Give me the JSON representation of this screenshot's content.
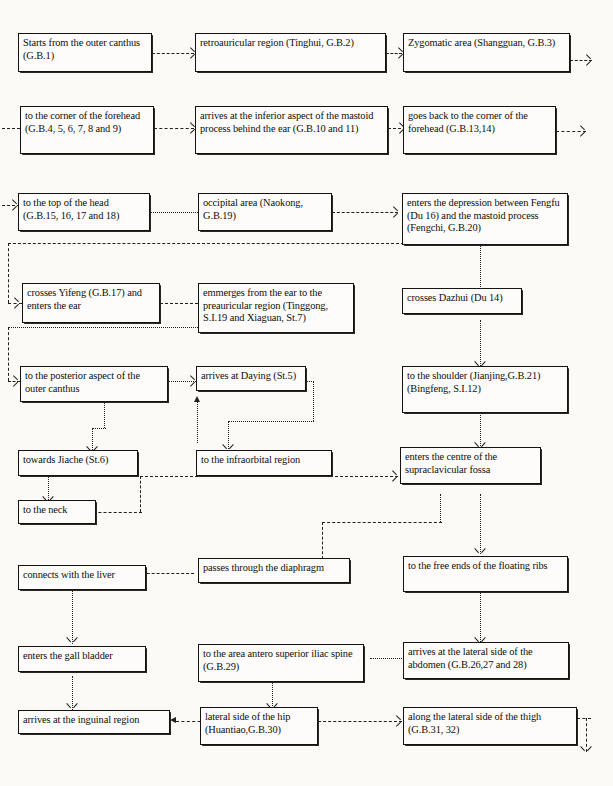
{
  "diagram": {
    "line_style": "dashed-and-dotted connectors with open arrowheads",
    "colors": {
      "background": "#fbfaf7",
      "box_border": "#15130f",
      "box_fill": "#fdfcfa",
      "connector": "#241f1a",
      "text": "#100e0b"
    }
  },
  "nodes": [
    {
      "id": "n01",
      "label": "Starts from the outer canthus (G.B.1)"
    },
    {
      "id": "n02",
      "label": "retroauricular region (Tinghui, G.B.2)"
    },
    {
      "id": "n03",
      "label": "Zygomatic area (Shangguan, G.B.3)"
    },
    {
      "id": "n04",
      "label": "to the corner of the forehead (G.B.4, 5, 6, 7, 8 and 9)"
    },
    {
      "id": "n05",
      "label": "arrives at the inferior aspect of the mastoid process behind the ear (G.B.10 and 11)"
    },
    {
      "id": "n06",
      "label": "goes back to the corner of the forehead (G.B.13,14)"
    },
    {
      "id": "n07",
      "label": "to the top of the head (G.B.15, 16, 17 and 18)"
    },
    {
      "id": "n08",
      "label": "occipital area (Naokong, G.B.19)"
    },
    {
      "id": "n09",
      "label": "enters the depression between Fengfu (Du 16) and the mastoid process (Fengchi, G.B.20)"
    },
    {
      "id": "n10",
      "label": "crosses Yifeng (G.B.17) and enters the ear"
    },
    {
      "id": "n11",
      "label": "emmerges from the ear to the preauricular region (Tinggong, S.I.19 and Xiaguan, St.7)"
    },
    {
      "id": "n12",
      "label": "crosses Dazhui (Du 14)"
    },
    {
      "id": "n13",
      "label": "to the posterior aspect of the outer canthus"
    },
    {
      "id": "n14",
      "label": "arrives at Daying (St.5)"
    },
    {
      "id": "n15",
      "label": "to the shoulder (Jianjing,G.B.21) (Bingfeng, S.I.12)"
    },
    {
      "id": "n16",
      "label": "towards Jiache (St.6)"
    },
    {
      "id": "n17",
      "label": "to the infraorbital region"
    },
    {
      "id": "n18",
      "label": "enters the centre of the supraclavicular fossa"
    },
    {
      "id": "n19",
      "label": "to the neck"
    },
    {
      "id": "n20",
      "label": "passes through the diaphragm"
    },
    {
      "id": "n21",
      "label": "to the free ends of the floating ribs"
    },
    {
      "id": "n22",
      "label": "connects with the liver"
    },
    {
      "id": "n23",
      "label": "enters the gall bladder"
    },
    {
      "id": "n24",
      "label": "to the area antero superior iliac spine (G.B.29)"
    },
    {
      "id": "n25",
      "label": "arrives at the lateral side of the abdomen (G.B.26,27 and 28)"
    },
    {
      "id": "n26",
      "label": "arrives at the inguinal region"
    },
    {
      "id": "n27",
      "label": "lateral side of the hip (Huantiao,G.B.30)"
    },
    {
      "id": "n28",
      "label": "along the lateral side of the thigh (G.B.31, 32)"
    }
  ],
  "edges": [
    {
      "from": "n01",
      "to": "n02",
      "style": "dashed",
      "direction": "right"
    },
    {
      "from": "n02",
      "to": "n03",
      "style": "dashed",
      "direction": "right"
    },
    {
      "from": "n03",
      "to": "n04",
      "style": "dashed",
      "direction": "wrap-right-to-left"
    },
    {
      "from": "n04",
      "to": "n05",
      "style": "dashed",
      "direction": "right"
    },
    {
      "from": "n05",
      "to": "n06",
      "style": "dashed",
      "direction": "right"
    },
    {
      "from": "n06",
      "to": "n07",
      "style": "dashed",
      "direction": "wrap-right-to-left"
    },
    {
      "from": "n07",
      "to": "n08",
      "style": "dotted",
      "direction": "right"
    },
    {
      "from": "n08",
      "to": "n09",
      "style": "dashed",
      "direction": "right"
    },
    {
      "from": "n09",
      "to": "n10",
      "style": "dashed",
      "direction": "wrap-left"
    },
    {
      "from": "n09",
      "to": "n12",
      "style": "dotted",
      "direction": "down"
    },
    {
      "from": "n10",
      "to": "n11",
      "style": "dashed",
      "direction": "right"
    },
    {
      "from": "n11",
      "to": "n13",
      "style": "dashed",
      "direction": "wrap-left"
    },
    {
      "from": "n13",
      "to": "n14",
      "style": "dotted",
      "direction": "right"
    },
    {
      "from": "n12",
      "to": "n15",
      "style": "dotted",
      "direction": "down"
    },
    {
      "from": "n13",
      "to": "n16",
      "style": "dotted",
      "direction": "down-left"
    },
    {
      "from": "n17",
      "to": "n14",
      "style": "dotted",
      "direction": "up"
    },
    {
      "from": "n14",
      "to": "n17",
      "style": "dotted",
      "direction": "down-right"
    },
    {
      "from": "n15",
      "to": "n18",
      "style": "dotted",
      "direction": "down"
    },
    {
      "from": "n16",
      "to": "n19",
      "style": "dotted",
      "direction": "down"
    },
    {
      "from": "n17",
      "to": "n18",
      "style": "dashed",
      "direction": "right"
    },
    {
      "from": "n19",
      "to": "n18",
      "style": "dashed",
      "direction": "right"
    },
    {
      "from": "n18",
      "to": "n20",
      "style": "dotted",
      "direction": "down-left"
    },
    {
      "from": "n18",
      "to": "n21",
      "style": "dotted",
      "direction": "down"
    },
    {
      "from": "n20",
      "to": "n22",
      "style": "dashed",
      "direction": "left"
    },
    {
      "from": "n21",
      "to": "n25",
      "style": "dotted",
      "direction": "down"
    },
    {
      "from": "n22",
      "to": "n23",
      "style": "dotted",
      "direction": "down"
    },
    {
      "from": "n25",
      "to": "n24",
      "style": "dotted",
      "direction": "left"
    },
    {
      "from": "n23",
      "to": "n26",
      "style": "dotted",
      "direction": "down"
    },
    {
      "from": "n24",
      "to": "n27",
      "style": "dotted",
      "direction": "down"
    },
    {
      "from": "n27",
      "to": "n26",
      "style": "dashed",
      "direction": "left"
    },
    {
      "from": "n27",
      "to": "n28",
      "style": "dashed",
      "direction": "right"
    },
    {
      "from": "n28",
      "to": "continues-below",
      "style": "dashed",
      "direction": "down"
    }
  ]
}
